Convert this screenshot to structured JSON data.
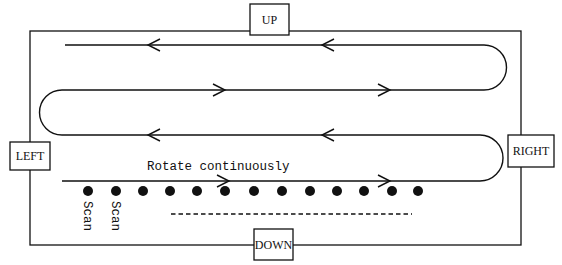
{
  "diagram": {
    "type": "scan-path",
    "colors": {
      "stroke": "#111111",
      "background": "#ffffff"
    },
    "frame": {
      "x1": 30,
      "y1": 31,
      "x2": 521,
      "y2": 245
    },
    "labels": {
      "up": "UP",
      "down": "DOWN",
      "left": "LEFT",
      "right": "RIGHT"
    },
    "annotation": "Rotate continuously",
    "scan_labels": [
      "Scan",
      "Scan"
    ],
    "scan_points_count": 13,
    "path_rows": [
      {
        "row": 1,
        "direction": "left"
      },
      {
        "row": 2,
        "direction": "right"
      },
      {
        "row": 3,
        "direction": "left"
      },
      {
        "row": 4,
        "direction": "right"
      }
    ]
  }
}
